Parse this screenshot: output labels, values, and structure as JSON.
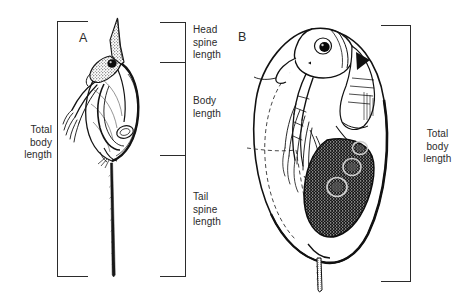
{
  "figure": {
    "background_color": "#ffffff",
    "ink_color": "#1a1a1a",
    "panels": [
      {
        "letter": "A",
        "name": "helmeted-long-tail-spine-form",
        "description": "Daphnia with long pointed head spine (helmet) and very long tail spine"
      },
      {
        "letter": "B",
        "name": "round-headed-gravid-form",
        "description": "Round-headed gravid Daphnia with dark brood pouch containing three embryos and short tail spine"
      }
    ],
    "panel_a_letter": "A",
    "panel_b_letter": "B",
    "measurements": {
      "total_body_length_left": "Total\nbody\nlength",
      "head_spine_length": "Head\nspine\nlength",
      "body_length": "Body\nlength",
      "tail_spine_length": "Tail\nspine\nlength",
      "total_body_length_right": "Total\nbody\nlength"
    },
    "brackets": [
      {
        "name": "total-body-length-bracket-a",
        "label": "Total body length",
        "spans": "entire specimen A including head spine and tail spine",
        "top_y": 21,
        "bottom_y": 277,
        "axis_x": 57,
        "tick_direction": "right"
      },
      {
        "name": "head-spine-length-bracket",
        "label": "Head spine length",
        "top_y": 22,
        "bottom_y": 62,
        "axis_x": 185,
        "tick_direction": "left"
      },
      {
        "name": "body-length-bracket",
        "label": "Body length",
        "top_y": 62,
        "bottom_y": 155,
        "axis_x": 185,
        "tick_direction": "left"
      },
      {
        "name": "tail-spine-length-bracket",
        "label": "Tail spine length",
        "top_y": 155,
        "bottom_y": 277,
        "axis_x": 185,
        "tick_direction": "left"
      },
      {
        "name": "total-body-length-bracket-b",
        "label": "Total body length",
        "spans": "entire specimen B",
        "top_y": 25,
        "bottom_y": 282,
        "axis_x": 410,
        "tick_direction": "left"
      }
    ]
  }
}
